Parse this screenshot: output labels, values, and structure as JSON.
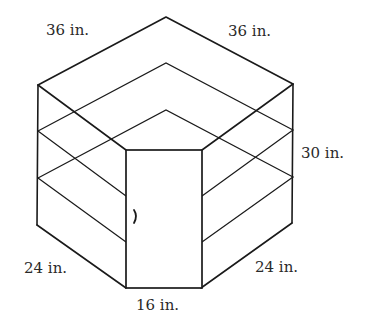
{
  "figure": {
    "labels": {
      "top_left_edge": "36 in.",
      "top_right_edge": "36 in.",
      "height": "30 in.",
      "bottom_left_edge": "24 in.",
      "bottom_right_edge": "24 in.",
      "door_width": "16 in."
    },
    "colors": {
      "line": "#1a1a1a",
      "text": "#2a2a2a",
      "background": "#ffffff"
    }
  }
}
